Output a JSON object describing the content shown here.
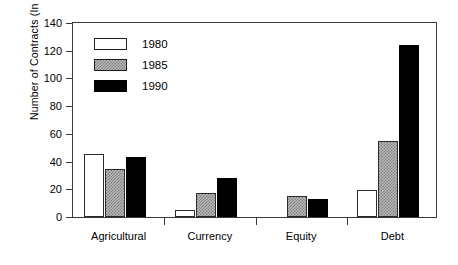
{
  "chart_data": {
    "type": "bar",
    "title": "",
    "xlabel": "",
    "ylabel": "Number of Contracts (In Millions)",
    "categories": [
      "Agricultural",
      "Currency",
      "Equity",
      "Debt"
    ],
    "series": [
      {
        "name": "1980",
        "values": [
          45,
          5,
          0,
          19
        ]
      },
      {
        "name": "1985",
        "values": [
          34,
          17,
          15,
          54
        ]
      },
      {
        "name": "1990",
        "values": [
          43,
          28,
          13,
          123
        ]
      }
    ],
    "ylim": [
      0,
      140
    ],
    "yticks": [
      0,
      20,
      40,
      60,
      80,
      100,
      120,
      140
    ],
    "ytick_labels": [
      "0",
      "20",
      "40",
      "60",
      "80",
      "100",
      "120",
      "140"
    ],
    "grid": false,
    "legend_position": "top-left",
    "legend_entries": [
      "1980",
      "1985",
      "1990"
    ],
    "style": {
      "1980": "white-outline",
      "1985": "gray-stipple",
      "1990": "black-solid"
    },
    "colors": {
      "1980": "#ffffff",
      "1985": "#b9b9b9",
      "1990": "#000000",
      "axis": "#3a3a3a",
      "outline": "#2b2b2b",
      "background": "#ffffff"
    }
  }
}
